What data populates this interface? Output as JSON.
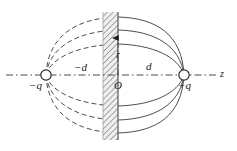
{
  "figure": {
    "width": 237,
    "height": 151,
    "background": "#ffffff",
    "line_color": "#2a2a2a",
    "hatch_color": "#8a8a8a",
    "band_fill": "#e8e8e8"
  },
  "axes": {
    "z_axis": {
      "label": "z",
      "label_x": 220,
      "label_y": 69,
      "style": "dash-dot",
      "y": 75,
      "x_start": 6,
      "x_end": 216
    },
    "r_axis": {
      "label": "r",
      "label_x": 116,
      "label_y": 50,
      "style": "dash-dot",
      "x": 118,
      "y_start": 75,
      "y_end": 36,
      "arrow": "up"
    },
    "origin": {
      "label": "O",
      "x": 118,
      "y": 75
    }
  },
  "charges": [
    {
      "name": "negative-charge",
      "label": "−q",
      "label_x": 29,
      "label_y": 80,
      "cx": 46,
      "cy": 75,
      "r": 5.2
    },
    {
      "name": "positive-charge",
      "label": "+q",
      "label_x": 178,
      "label_y": 80,
      "cx": 184,
      "cy": 75,
      "r": 5.2
    }
  ],
  "distance_labels": [
    {
      "name": "minus-d",
      "text": "−d",
      "x": 74,
      "y": 62
    },
    {
      "name": "plus-d",
      "text": "d",
      "x": 146,
      "y": 61
    }
  ],
  "plane": {
    "name": "hatched-plane",
    "x": 103,
    "y": 12,
    "width": 15,
    "height": 128,
    "hatch_angle_deg": 45,
    "hatch_spacing": 3
  },
  "field_lines": {
    "dashed_side": "left",
    "solid_side": "right",
    "count": 3,
    "note": "Three nested dipole field loops, upper and lower halves mirrored"
  }
}
